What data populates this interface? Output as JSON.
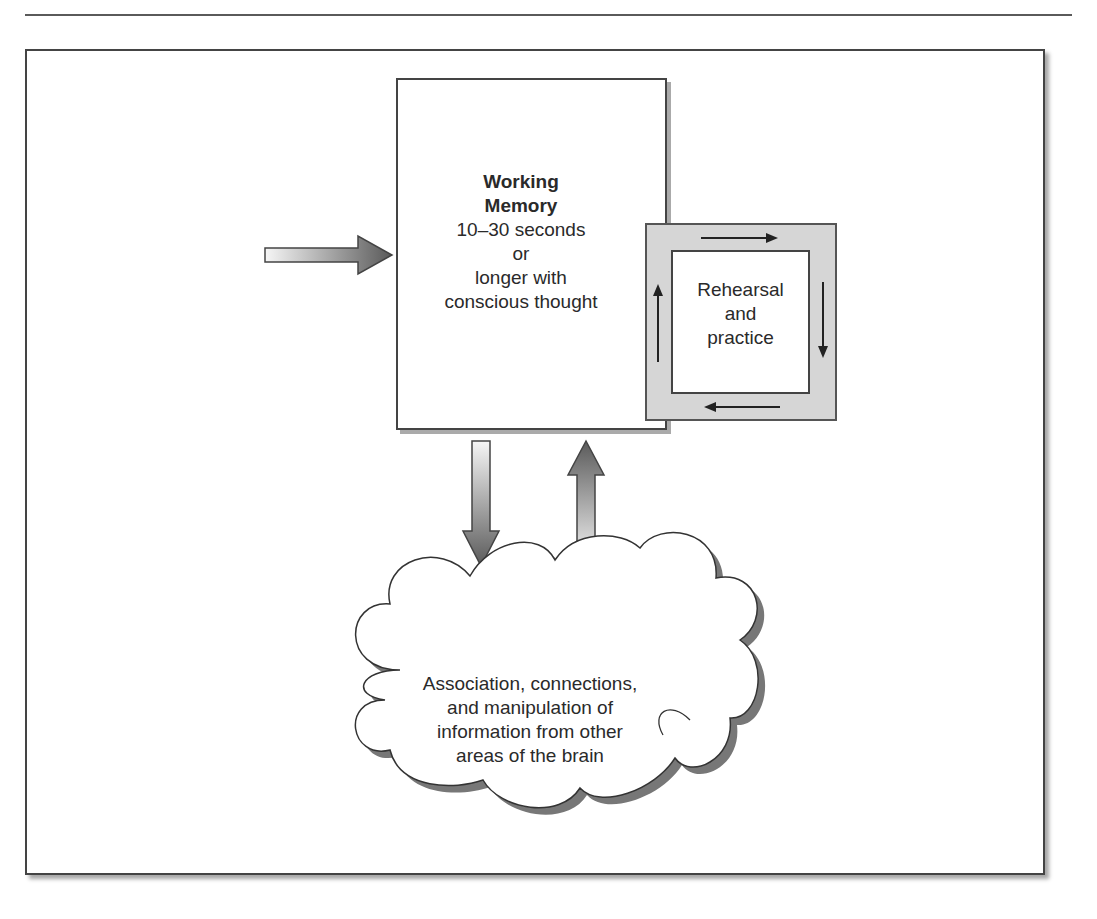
{
  "figure": {
    "working_memory": {
      "title_line1": "Working",
      "title_line2": "Memory",
      "line1": "10–30 seconds",
      "line2": "or",
      "line3": "longer with",
      "line4": "conscious thought"
    },
    "rehearsal": {
      "line1": "Rehearsal",
      "line2": "and",
      "line3": "practice"
    },
    "cloud": {
      "line1": "Association, connections,",
      "line2": "and manipulation of",
      "line3": "information from other",
      "line4": "areas of the brain"
    }
  },
  "colors": {
    "border": "#444444",
    "rehearsal_fill": "#d6d6d6",
    "arrow_dark": "#555555",
    "arrow_light": "#f4f4f4"
  }
}
